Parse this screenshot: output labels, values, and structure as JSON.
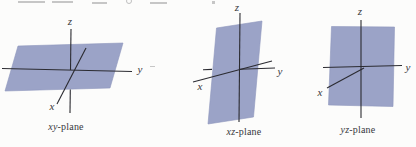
{
  "colors": {
    "background": "#fcfcfb",
    "plane_fill": "#9ba3c7",
    "plane_edge": "#8d95bc",
    "axis": "#2b2b31",
    "label": "#38383c"
  },
  "panels": [
    {
      "name": "xy-plane",
      "z": "z",
      "y": "y",
      "x": "x",
      "caption": {
        "math": "xy",
        "suffix": "-plane"
      }
    },
    {
      "name": "xz-plane",
      "z": "z",
      "y": "y",
      "x": "x",
      "caption": {
        "math": "xz",
        "suffix": "-plane"
      }
    },
    {
      "name": "yz-plane",
      "z": "z",
      "y": "y",
      "x": "x",
      "caption": {
        "math": "yz",
        "suffix": "-plane"
      }
    }
  ]
}
